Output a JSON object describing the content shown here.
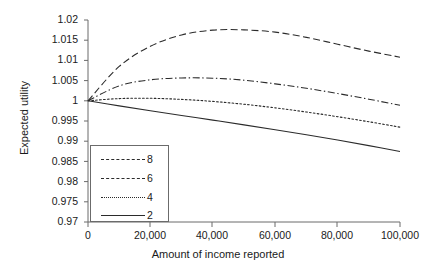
{
  "chart_data": {
    "type": "line",
    "title": "",
    "xlabel": "Amount of income reported",
    "ylabel": "Expected utility",
    "xlim": [
      0,
      100000
    ],
    "ylim": [
      0.97,
      1.02
    ],
    "xticks": [
      "0",
      "20,000",
      "40,000",
      "60,000",
      "80,000",
      "100,000"
    ],
    "xtick_values": [
      0,
      20000,
      40000,
      60000,
      80000,
      100000
    ],
    "yticks": [
      "1.02",
      "1.015",
      "1.01",
      "1.005",
      "1",
      "0.995",
      "0.99",
      "0.985",
      "0.98",
      "0.975",
      "0.97"
    ],
    "ytick_values": [
      1.02,
      1.015,
      1.01,
      1.005,
      1.0,
      0.995,
      0.99,
      0.985,
      0.98,
      0.975,
      0.97
    ],
    "grid": false,
    "legend_position": "lower-left-inside",
    "x": [
      0,
      10000,
      20000,
      30000,
      40000,
      50000,
      60000,
      70000,
      80000,
      90000,
      100000
    ],
    "series": [
      {
        "name": "8",
        "style": "dashed",
        "values": [
          1.0,
          1.0085,
          1.0135,
          1.0163,
          1.0175,
          1.01755,
          1.017,
          1.0157,
          1.014,
          1.0123,
          1.0108
        ]
      },
      {
        "name": "6",
        "style": "dash-dot",
        "values": [
          1.0,
          1.0037,
          1.0052,
          1.00565,
          1.0056,
          1.0051,
          1.0042,
          1.0031,
          1.0018,
          1.0004,
          0.9989
        ]
      },
      {
        "name": "4",
        "style": "dotted",
        "values": [
          1.0,
          1.00055,
          1.00062,
          1.00035,
          0.99985,
          0.99915,
          0.99825,
          0.99722,
          0.99607,
          0.99482,
          0.99347
        ]
      },
      {
        "name": "2",
        "style": "solid",
        "values": [
          1.0,
          0.99875,
          0.99755,
          0.99638,
          0.99522,
          0.99405,
          0.99285,
          0.9916,
          0.99028,
          0.9889,
          0.98745
        ]
      }
    ],
    "colors": {
      "line": "#2b2b2b",
      "axis": "#6b6b6b",
      "text": "#1a1a1a",
      "background": "#ffffff"
    },
    "legend_entries": [
      {
        "label": "8",
        "style": "dashed"
      },
      {
        "label": "6",
        "style": "dash-dot"
      },
      {
        "label": "4",
        "style": "dotted"
      },
      {
        "label": "2",
        "style": "solid"
      }
    ]
  }
}
